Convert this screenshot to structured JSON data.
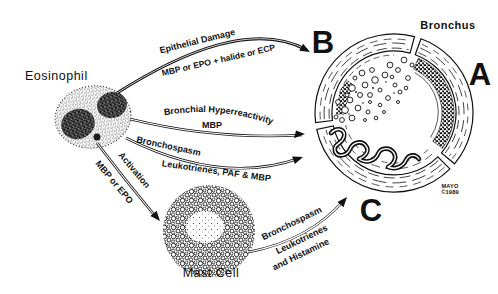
{
  "figure": {
    "type": "pathway-diagram",
    "labels": {
      "eosinophil": "Eosinophil",
      "mast_cell": "Mast Cell",
      "bronchus": "Bronchus",
      "section_a": "A",
      "section_b": "B",
      "section_c": "C",
      "credit_line1": "MAYO",
      "credit_line2": "©1989"
    },
    "colors": {
      "ink": "#111111",
      "paper": "#ffffff"
    }
  },
  "arrows": [
    {
      "id": "epithelial-damage",
      "source": "Eosinophil",
      "target": "Bronchus section B",
      "line1": "Epithelial Damage",
      "line2": "MBP or EPO + halide or ECP"
    },
    {
      "id": "bronchial-hyperreactivity",
      "source": "Eosinophil",
      "target": "Bronchus",
      "line1": "Bronchial Hyperreactivity",
      "line2": "MBP"
    },
    {
      "id": "bronchospasm-eosinophil",
      "source": "Eosinophil",
      "target": "Bronchus",
      "line1": "Bronchospasm",
      "line2": "Leukotrienes, PAF & MBP"
    },
    {
      "id": "activation",
      "source": "Eosinophil",
      "target": "Mast Cell",
      "line1": "Activation",
      "line2": "MBP or EPO"
    },
    {
      "id": "bronchospasm-mast-cell",
      "source": "Mast Cell",
      "target": "Bronchus section C",
      "line1": "Bronchospasm",
      "line2": "Leukotrienes",
      "line3": "and Histamine"
    }
  ]
}
